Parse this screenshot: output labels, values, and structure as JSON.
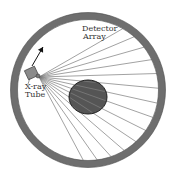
{
  "diagram": {
    "labels": {
      "detector_line1": "Detector",
      "detector_line2": "Array",
      "tube_line1": "X-ray",
      "tube_line2": "Tube"
    },
    "colors": {
      "background": "#ffffff",
      "ring": "#6e6e6e",
      "ring_outline": "#4a4a4a",
      "object_fill": "#555555",
      "object_outline": "#222222",
      "tube_fill": "#8a8a8a",
      "rays": "#7a7a7a",
      "arrow": "#111111",
      "text": "#333333"
    },
    "ring": {
      "cx": 88,
      "cy": 90,
      "r": 74,
      "thickness": 7
    },
    "object": {
      "cx": 88,
      "cy": 97,
      "rx": 19,
      "ry": 17
    },
    "tube": {
      "x": 26,
      "y": 68,
      "w": 11,
      "h": 10,
      "rotation": -25,
      "source_x": 39,
      "source_y": 77
    },
    "arrow": {
      "x1": 32,
      "y1": 66,
      "x2": 43,
      "y2": 47
    },
    "rays": {
      "count": 14,
      "start_angle_deg": -30,
      "end_angle_deg": 62
    }
  }
}
